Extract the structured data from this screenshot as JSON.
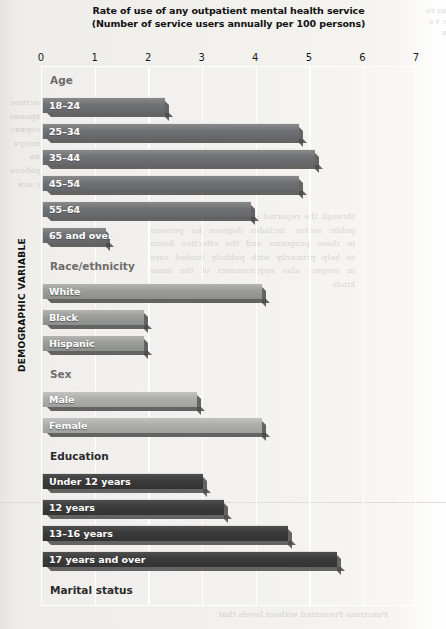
{
  "chart_data": {
    "type": "bar",
    "orientation": "horizontal",
    "title": "Rate of use of any outpatient mental health service",
    "subtitle": "(Number of service users annually per 100 persons)",
    "xlabel": "",
    "ylabel": "DEMOGRAPHIC VARIABLE",
    "xlim": [
      0,
      7
    ],
    "xticks": [
      0,
      1,
      2,
      3,
      4,
      5,
      6,
      7
    ],
    "grid": true,
    "legend": "none",
    "groups": [
      {
        "name": "Age",
        "heading_style": "light",
        "series_color": "#6f7175",
        "categories": [
          "18–24",
          "25–34",
          "35–44",
          "45–54",
          "55–64",
          "65 and over"
        ],
        "values": [
          2.3,
          4.8,
          5.1,
          4.8,
          3.9,
          1.2
        ]
      },
      {
        "name": "Race/ethnicity",
        "heading_style": "light",
        "series_color": "#9b9c9a",
        "categories": [
          "White",
          "Black",
          "Hispanic"
        ],
        "values": [
          4.1,
          1.9,
          1.9
        ]
      },
      {
        "name": "Sex",
        "heading_style": "light",
        "series_color": "#adaeac",
        "categories": [
          "Male",
          "Female"
        ],
        "values": [
          2.9,
          4.1
        ]
      },
      {
        "name": "Education",
        "heading_style": "dark",
        "series_color": "#3b3b3b",
        "categories": [
          "Under 12 years",
          "12 years",
          "13–16 years",
          "17 years and over"
        ],
        "values": [
          3.0,
          3.4,
          4.6,
          5.5
        ]
      },
      {
        "name": "Marital status",
        "heading_style": "dark",
        "series_color": "#414141",
        "categories": [
          "Not married",
          "Married",
          "Divorced/separated"
        ],
        "values": [
          4.4,
          3.2,
          6.4
        ]
      }
    ]
  },
  "page_bleed": {
    "left": "остное храние сервис получ на работе с осн",
    "mid": "through the reported service use in recent the public  sector   includes  degrees  for  persons  in  these  programs  and  the  effective  hours  to  help  primarily  with  publicly  funded  care  in  respect  also  requirements  of  the  same  kinds",
    "right": "из го с т е к",
    "bottom": "Functions Presented without levels that"
  }
}
